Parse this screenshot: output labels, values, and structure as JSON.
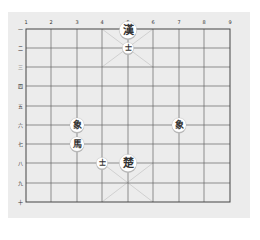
{
  "game": "Xiangqi (Chinese Chess)",
  "board": {
    "files": [
      "1",
      "2",
      "3",
      "4",
      "5",
      "6",
      "7",
      "8",
      "9"
    ],
    "ranks": [
      "一",
      "二",
      "三",
      "四",
      "五",
      "六",
      "七",
      "八",
      "九",
      "十"
    ],
    "colors": {
      "panel": "#ececec",
      "grid": "#555555",
      "diagonal": "#c9c9c9",
      "piece_face": "#ffffff",
      "piece_text": "#333333"
    }
  },
  "pieces": [
    {
      "char": "漢",
      "role": "general",
      "side": "top",
      "file": 5,
      "rank": 1,
      "size": "large"
    },
    {
      "char": "士",
      "role": "advisor",
      "side": "top",
      "file": 5,
      "rank": 2,
      "size": "small"
    },
    {
      "char": "象",
      "role": "elephant",
      "side": "bottom",
      "file": 3,
      "rank": 6,
      "size": "normal"
    },
    {
      "char": "馬",
      "role": "horse",
      "side": "bottom",
      "file": 3,
      "rank": 7,
      "size": "normal"
    },
    {
      "char": "象",
      "role": "elephant",
      "side": "bottom",
      "file": 7,
      "rank": 6,
      "size": "normal"
    },
    {
      "char": "士",
      "role": "advisor",
      "side": "bottom",
      "file": 4,
      "rank": 8,
      "size": "small"
    },
    {
      "char": "楚",
      "role": "general",
      "side": "bottom",
      "file": 5,
      "rank": 8,
      "size": "large"
    }
  ]
}
